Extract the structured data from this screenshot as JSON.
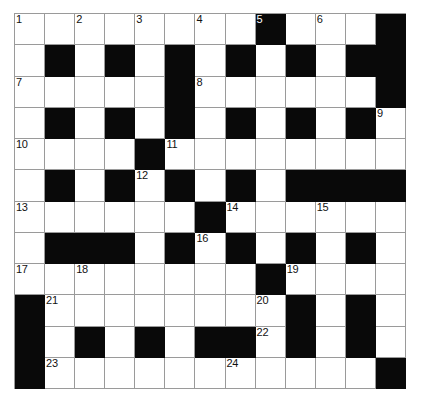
{
  "puzzle": {
    "title": "Crossword Grid",
    "columns": 13,
    "rows": 12,
    "cell_size_px": 30,
    "colors": {
      "block": "#090909",
      "open": "#ffffff",
      "grid_line": "#9a9a9a",
      "number_text": "#111111",
      "page_background": "#ffffff"
    },
    "legend": {
      "block_symbol": "#",
      "open_symbol": "."
    },
    "grid": [
      "........#...#",
      ".#.#.#.#.#.##",
      ".....#......#",
      ".#.#.#.#.#.#.",
      "....#........",
      ".#.#.#.#.####",
      "......#......",
      ".###.#.#.#.#.",
      "........#....",
      "#........#.#.",
      "#.#.#.##.#.#.",
      "#...........#"
    ],
    "numbers": [
      {
        "n": 1,
        "row": 1,
        "col": 1
      },
      {
        "n": 2,
        "row": 1,
        "col": 3
      },
      {
        "n": 3,
        "row": 1,
        "col": 5
      },
      {
        "n": 4,
        "row": 1,
        "col": 7
      },
      {
        "n": 5,
        "row": 1,
        "col": 9
      },
      {
        "n": 6,
        "row": 1,
        "col": 11
      },
      {
        "n": 7,
        "row": 3,
        "col": 1
      },
      {
        "n": 8,
        "row": 3,
        "col": 7
      },
      {
        "n": 9,
        "row": 4,
        "col": 13
      },
      {
        "n": 10,
        "row": 5,
        "col": 1
      },
      {
        "n": 11,
        "row": 5,
        "col": 6
      },
      {
        "n": 12,
        "row": 6,
        "col": 5
      },
      {
        "n": 13,
        "row": 7,
        "col": 1
      },
      {
        "n": 14,
        "row": 7,
        "col": 8
      },
      {
        "n": 15,
        "row": 7,
        "col": 11
      },
      {
        "n": 16,
        "row": 8,
        "col": 7
      },
      {
        "n": 17,
        "row": 9,
        "col": 1
      },
      {
        "n": 18,
        "row": 9,
        "col": 3
      },
      {
        "n": 19,
        "row": 9,
        "col": 10
      },
      {
        "n": 20,
        "row": 10,
        "col": 9
      },
      {
        "n": 21,
        "row": 10,
        "col": 2
      },
      {
        "n": 22,
        "row": 11,
        "col": 9
      },
      {
        "n": 23,
        "row": 12,
        "col": 2
      },
      {
        "n": 24,
        "row": 12,
        "col": 8
      }
    ],
    "entries": []
  }
}
